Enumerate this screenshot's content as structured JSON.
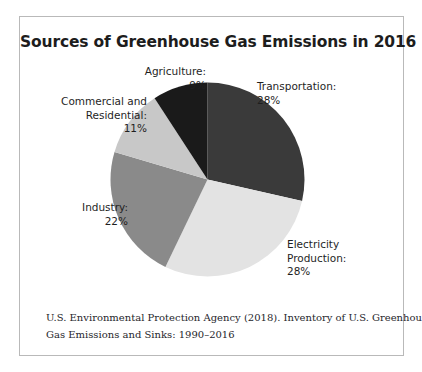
{
  "figure": {
    "title": "Sources of Greenhouse Gas Emissions in 2016",
    "citation_line_1": "U.S. Environmental Protection Agency (2018). Inventory of U.S. Greenhouse",
    "citation_line_2": "Gas Emissions and Sinks: 1990–2016",
    "frame_border_color": "#b9b9b9",
    "background_color": "#ffffff"
  },
  "labels": {
    "agriculture": {
      "line1": "Agriculture:",
      "line2": "9%"
    },
    "commercial_residential": {
      "line1": "Commercial and",
      "line2": "Residential:",
      "line3": "11%"
    },
    "industry": {
      "line1": "Industry:",
      "line2": "22%"
    },
    "transportation": {
      "line1": "Transportation:",
      "line2": "28%"
    },
    "electricity_production": {
      "line1": "Electricity",
      "line2": "Production:",
      "line3": "28%"
    }
  },
  "chart_data": {
    "type": "pie",
    "title": "Sources of Greenhouse Gas Emissions in 2016",
    "xlabel": "",
    "ylabel": "",
    "legend_position": "none",
    "labels_position": "outside-callout-free",
    "start_angle_deg": 0,
    "direction": "clockwise",
    "units": "percent",
    "total": 98,
    "categories": [
      "Transportation",
      "Electricity Production",
      "Industry",
      "Commercial and Residential",
      "Agriculture"
    ],
    "values": [
      28,
      28,
      22,
      11,
      9
    ],
    "colors": [
      "#3a3a3a",
      "#e3e3e3",
      "#8a8a8a",
      "#c8c8c8",
      "#1a1a1a"
    ],
    "slices": [
      {
        "name": "Transportation",
        "value": 28,
        "display": "28%",
        "color": "#3a3a3a"
      },
      {
        "name": "Electricity Production",
        "value": 28,
        "display": "28%",
        "color": "#e3e3e3"
      },
      {
        "name": "Industry",
        "value": 22,
        "display": "22%",
        "color": "#8a8a8a"
      },
      {
        "name": "Commercial and Residential",
        "value": 11,
        "display": "11%",
        "color": "#c8c8c8"
      },
      {
        "name": "Agriculture",
        "value": 9,
        "display": "9%",
        "color": "#1a1a1a"
      }
    ],
    "source": "U.S. Environmental Protection Agency (2018). Inventory of U.S. Greenhouse Gas Emissions and Sinks: 1990–2016"
  }
}
